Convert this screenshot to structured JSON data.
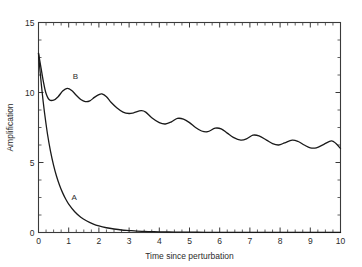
{
  "figure": {
    "background_color": "#ffffff",
    "axis_color": "#3a3a3a",
    "curve_color": "#1a1a1a"
  },
  "chart_data": {
    "type": "line",
    "title": "",
    "xlabel": "Time since perturbation",
    "ylabel": "Amplification",
    "xlim": [
      0,
      10
    ],
    "ylim": [
      0,
      15
    ],
    "x_ticks": [
      0,
      1,
      2,
      3,
      4,
      5,
      6,
      7,
      8,
      9,
      10
    ],
    "x_tick_labels": [
      "0",
      "1",
      "2",
      "3",
      "4",
      "5",
      "6",
      "7",
      "8",
      "9",
      "10"
    ],
    "x_minor_tick_step": 0.25,
    "y_ticks": [
      0,
      5,
      10,
      15
    ],
    "y_tick_labels": [
      "0",
      "5",
      "10",
      "15"
    ],
    "y_minor_tick_step": 1.25,
    "grid": false,
    "legend": "inline-annotations",
    "annotations": [
      {
        "text": "A",
        "x": 1.18,
        "y": 2.35
      },
      {
        "text": "B",
        "x": 1.22,
        "y": 10.95
      }
    ],
    "series": [
      {
        "name": "A",
        "label": "A",
        "description": "monotonic exponential decay of amplification to zero",
        "x": [
          0,
          0.05,
          0.1,
          0.15,
          0.2,
          0.3,
          0.4,
          0.5,
          0.6,
          0.7,
          0.8,
          0.9,
          1.0,
          1.2,
          1.4,
          1.6,
          1.8,
          2.0,
          2.25,
          2.5,
          2.75,
          3.0,
          3.25,
          3.5,
          3.75,
          4.0,
          4.5,
          5.0,
          5.5,
          6.0,
          6.5,
          7.0,
          7.5,
          8.0,
          8.5,
          9.0,
          9.5,
          10.0
        ],
        "y": [
          12.8,
          11.55,
          10.45,
          9.45,
          8.55,
          7.0,
          5.78,
          4.8,
          4.0,
          3.36,
          2.83,
          2.39,
          2.03,
          1.48,
          1.09,
          0.82,
          0.62,
          0.47,
          0.34,
          0.25,
          0.18,
          0.14,
          0.1,
          0.08,
          0.06,
          0.05,
          0.03,
          0.02,
          0.015,
          0.012,
          0.01,
          0.008,
          0.007,
          0.006,
          0.005,
          0.004,
          0.004,
          0.003
        ]
      },
      {
        "name": "B",
        "label": "B",
        "description": "damped oscillation settling toward a lower sustained amplification",
        "x": [
          0,
          0.08,
          0.16,
          0.24,
          0.35,
          0.5,
          0.65,
          0.8,
          0.95,
          1.1,
          1.25,
          1.4,
          1.55,
          1.7,
          1.85,
          2.0,
          2.1,
          2.25,
          2.4,
          2.6,
          2.8,
          3.0,
          3.15,
          3.4,
          3.55,
          3.75,
          4.0,
          4.2,
          4.4,
          4.6,
          4.8,
          5.0,
          5.2,
          5.4,
          5.6,
          5.85,
          6.05,
          6.25,
          6.45,
          6.7,
          6.9,
          7.1,
          7.3,
          7.55,
          7.75,
          7.95,
          8.15,
          8.4,
          8.6,
          8.8,
          9.0,
          9.2,
          9.45,
          9.7,
          9.85,
          10.0
        ],
        "y": [
          12.8,
          11.8,
          10.8,
          10.0,
          9.5,
          9.45,
          9.7,
          10.1,
          10.3,
          10.15,
          9.8,
          9.5,
          9.35,
          9.4,
          9.65,
          9.85,
          9.9,
          9.7,
          9.3,
          8.9,
          8.6,
          8.5,
          8.55,
          8.7,
          8.6,
          8.2,
          7.85,
          7.75,
          7.9,
          8.15,
          8.1,
          7.85,
          7.5,
          7.25,
          7.2,
          7.45,
          7.4,
          7.1,
          6.8,
          6.6,
          6.7,
          6.95,
          6.9,
          6.6,
          6.35,
          6.25,
          6.4,
          6.6,
          6.5,
          6.25,
          6.05,
          6.05,
          6.3,
          6.55,
          6.35,
          6.0
        ]
      }
    ]
  }
}
